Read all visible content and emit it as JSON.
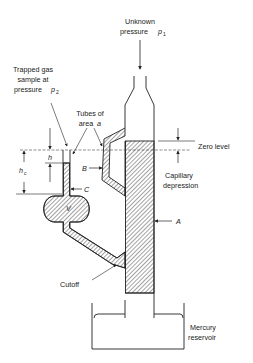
{
  "diagram": {
    "labels": {
      "unknown_pressure_line1": "Unknown",
      "unknown_pressure_line2": "pressure",
      "p1_symbol": "p",
      "p1_subscript": "1",
      "trapped_gas_line1": "Trapped gas",
      "trapped_gas_line2": "sample at",
      "trapped_gas_line3": "pressure",
      "p2_symbol": "p",
      "p2_subscript": "2",
      "tubes_line1": "Tubes of",
      "tubes_line2": "area",
      "tubes_symbol": "a",
      "zero_level": "Zero level",
      "capillary_line1": "Capillary",
      "capillary_line2": "depression",
      "h": "h",
      "hc": "h",
      "hc_subscript": "c",
      "B": "B",
      "C": "C",
      "V": "V",
      "A": "A",
      "cutoff": "Cutoff",
      "mercury_line1": "Mercury",
      "mercury_line2": "reservoir"
    },
    "colors": {
      "stroke": "#222222",
      "hatch": "#333333",
      "background": "#ffffff"
    }
  }
}
